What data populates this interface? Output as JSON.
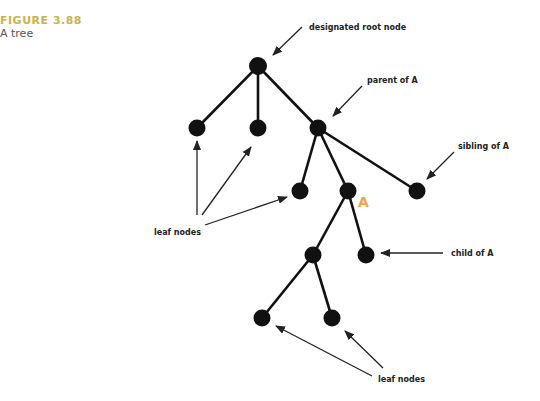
{
  "caption": {
    "figure_label": "FIGURE 3.88",
    "title": "A tree"
  },
  "labels": {
    "root": "designated root node",
    "parent": "parent of A",
    "sibling": "sibling of A",
    "child": "child of A",
    "leaf_left": "leaf nodes",
    "leaf_bottom": "leaf nodes",
    "node_a": "A"
  },
  "colors": {
    "caption_accent": "#c9b34a",
    "node_a_label": "#f0a050",
    "nodes": "#111111"
  },
  "tree": {
    "nodes": [
      {
        "id": "root",
        "x": 258,
        "y": 66
      },
      {
        "id": "leaf1",
        "x": 197,
        "y": 128
      },
      {
        "id": "leaf2",
        "x": 258,
        "y": 128
      },
      {
        "id": "parentA",
        "x": 318,
        "y": 128
      },
      {
        "id": "leaf3",
        "x": 300,
        "y": 191
      },
      {
        "id": "A",
        "x": 348,
        "y": 191
      },
      {
        "id": "siblingA",
        "x": 417,
        "y": 191
      },
      {
        "id": "inner",
        "x": 313,
        "y": 255
      },
      {
        "id": "childA",
        "x": 366,
        "y": 255
      },
      {
        "id": "leaf4",
        "x": 262,
        "y": 318
      },
      {
        "id": "leaf5",
        "x": 332,
        "y": 318
      }
    ]
  }
}
